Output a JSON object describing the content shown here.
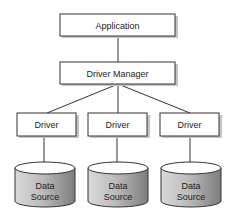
{
  "diagram": {
    "type": "architecture",
    "nodes": {
      "application": {
        "label": "Application"
      },
      "driver_manager": {
        "label": "Driver Manager"
      },
      "drivers": [
        {
          "label": "Driver"
        },
        {
          "label": "Driver"
        },
        {
          "label": "Driver"
        }
      ],
      "data_sources": [
        {
          "line1": "Data",
          "line2": "Source"
        },
        {
          "line1": "Data",
          "line2": "Source"
        },
        {
          "line1": "Data",
          "line2": "Source"
        }
      ]
    },
    "edges": [
      [
        "Application",
        "Driver Manager"
      ],
      [
        "Driver Manager",
        "Driver 1"
      ],
      [
        "Driver Manager",
        "Driver 2"
      ],
      [
        "Driver Manager",
        "Driver 3"
      ],
      [
        "Driver 1",
        "Data Source 1"
      ],
      [
        "Driver 2",
        "Data Source 2"
      ],
      [
        "Driver 3",
        "Data Source 3"
      ]
    ],
    "colors": {
      "box_fill": "#ffffff",
      "stroke": "#333333",
      "shadow": "#bdbdbd",
      "cylinder_dark": "#8a8a8a",
      "cylinder_light": "#e6e6e6"
    }
  }
}
